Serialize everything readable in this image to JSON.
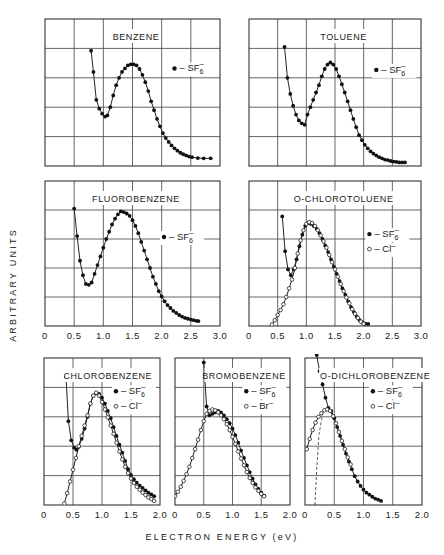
{
  "figure": {
    "ylabel": "ARBITRARY   UNITS",
    "xlabel": "ELECTRON   ENERGY   (eV)"
  },
  "chart_data": [
    {
      "type": "scatter",
      "title": "BENZENE",
      "xlabel": "Electron Energy (eV)",
      "ylabel": "Arbitrary Units",
      "xlim": [
        0,
        3.0
      ],
      "ylim": [
        0,
        5
      ],
      "xticks": [
        "0",
        "0.5",
        "1.0",
        "1.5",
        "2.0",
        "2.5",
        "3.0"
      ],
      "grid": true,
      "legend": [
        "• – SF6⁻"
      ],
      "series": [
        {
          "name": "SF6-",
          "marker": "filled",
          "x": [
            0.79,
            0.83,
            0.88,
            0.93,
            0.98,
            1.03,
            1.07,
            1.12,
            1.17,
            1.22,
            1.27,
            1.32,
            1.37,
            1.42,
            1.47,
            1.52,
            1.57,
            1.62,
            1.67,
            1.72,
            1.77,
            1.82,
            1.87,
            1.92,
            1.97,
            2.02,
            2.07,
            2.12,
            2.17,
            2.22,
            2.27,
            2.32,
            2.37,
            2.42,
            2.47,
            2.52,
            2.62,
            2.72,
            2.84
          ],
          "y": [
            3.92,
            3.2,
            2.25,
            1.95,
            1.78,
            1.68,
            1.72,
            2.0,
            2.4,
            2.75,
            3.0,
            3.2,
            3.32,
            3.42,
            3.46,
            3.46,
            3.42,
            3.3,
            3.1,
            2.85,
            2.55,
            2.2,
            1.9,
            1.6,
            1.35,
            1.12,
            0.95,
            0.82,
            0.7,
            0.6,
            0.52,
            0.45,
            0.4,
            0.36,
            0.32,
            0.3,
            0.27,
            0.26,
            0.26
          ]
        }
      ]
    },
    {
      "type": "scatter",
      "title": "TOLUENE",
      "xlim": [
        0,
        3.0
      ],
      "ylim": [
        0,
        5
      ],
      "xticks": [
        "0",
        "0.5",
        "1.0",
        "1.5",
        "2.0",
        "2.5",
        "3.0"
      ],
      "grid": true,
      "legend": [
        "• – SF6⁻"
      ],
      "series": [
        {
          "name": "SF6-",
          "marker": "filled",
          "x": [
            0.62,
            0.67,
            0.72,
            0.77,
            0.82,
            0.87,
            0.92,
            0.97,
            1.02,
            1.07,
            1.12,
            1.17,
            1.22,
            1.27,
            1.32,
            1.37,
            1.42,
            1.47,
            1.52,
            1.57,
            1.62,
            1.67,
            1.72,
            1.77,
            1.82,
            1.87,
            1.92,
            1.97,
            2.02,
            2.07,
            2.12,
            2.17,
            2.22,
            2.27,
            2.32,
            2.37,
            2.42,
            2.47,
            2.52,
            2.57,
            2.62,
            2.67,
            2.72
          ],
          "y": [
            4.05,
            3.0,
            2.45,
            2.05,
            1.75,
            1.55,
            1.45,
            1.4,
            1.75,
            2.0,
            2.25,
            2.5,
            2.75,
            3.05,
            3.3,
            3.45,
            3.52,
            3.45,
            3.3,
            3.05,
            2.78,
            2.5,
            2.2,
            1.9,
            1.6,
            1.32,
            1.05,
            0.88,
            0.72,
            0.6,
            0.5,
            0.42,
            0.36,
            0.3,
            0.26,
            0.22,
            0.2,
            0.17,
            0.15,
            0.14,
            0.12,
            0.12,
            0.12
          ]
        }
      ]
    },
    {
      "type": "scatter",
      "title": "FLUOROBENZENE",
      "xlim": [
        0,
        3.0
      ],
      "ylim": [
        0,
        5
      ],
      "xticks": [
        "0",
        "0.5",
        "1.0",
        "1.5",
        "2.0",
        "2.5",
        "3.0"
      ],
      "grid": true,
      "legend": [
        "• – SF6⁻"
      ],
      "series": [
        {
          "name": "SF6-",
          "marker": "filled",
          "x": [
            0.5,
            0.55,
            0.6,
            0.65,
            0.7,
            0.75,
            0.8,
            0.85,
            0.9,
            0.95,
            1.0,
            1.05,
            1.1,
            1.15,
            1.2,
            1.25,
            1.3,
            1.35,
            1.4,
            1.45,
            1.5,
            1.55,
            1.6,
            1.65,
            1.7,
            1.75,
            1.8,
            1.85,
            1.9,
            1.95,
            2.0,
            2.05,
            2.1,
            2.15,
            2.2,
            2.25,
            2.3,
            2.35,
            2.4,
            2.45,
            2.5,
            2.55,
            2.6,
            2.63
          ],
          "y": [
            4.05,
            3.1,
            2.25,
            1.75,
            1.45,
            1.42,
            1.5,
            1.8,
            2.1,
            2.4,
            2.7,
            3.0,
            3.25,
            3.5,
            3.7,
            3.85,
            3.95,
            3.93,
            3.88,
            3.8,
            3.65,
            3.45,
            3.2,
            2.9,
            2.6,
            2.3,
            2.0,
            1.7,
            1.45,
            1.2,
            1.02,
            0.85,
            0.72,
            0.62,
            0.52,
            0.45,
            0.38,
            0.32,
            0.28,
            0.25,
            0.22,
            0.2,
            0.18,
            0.17
          ]
        }
      ]
    },
    {
      "type": "scatter",
      "title": "O-CHLOROTOLUENE",
      "xlim": [
        0,
        3.0
      ],
      "ylim": [
        0,
        5
      ],
      "xticks": [
        "0",
        "0.5",
        "1.0",
        "1.5",
        "2.0",
        "2.5",
        "3.0"
      ],
      "grid": true,
      "legend": [
        "• – SF6⁻",
        "◦ – Cl⁻"
      ],
      "series": [
        {
          "name": "SF6-",
          "marker": "filled",
          "x": [
            0.58,
            0.63,
            0.68,
            0.73,
            0.78,
            0.83,
            0.88,
            0.93,
            0.98,
            1.03,
            1.08,
            1.13,
            1.18,
            1.23,
            1.28,
            1.33,
            1.38,
            1.43,
            1.48,
            1.53,
            1.58,
            1.63,
            1.68,
            1.73,
            1.78,
            1.83,
            1.88,
            1.93,
            1.98,
            2.03,
            2.08
          ],
          "y": [
            3.78,
            2.58,
            1.95,
            1.75,
            1.95,
            2.3,
            2.75,
            3.15,
            3.45,
            3.55,
            3.52,
            3.45,
            3.35,
            3.2,
            3.0,
            2.78,
            2.55,
            2.3,
            2.05,
            1.8,
            1.55,
            1.3,
            1.08,
            0.85,
            0.65,
            0.48,
            0.32,
            0.2,
            0.12,
            0.08,
            0.07
          ]
        },
        {
          "name": "Cl-",
          "marker": "open",
          "x": [
            0.4,
            0.45,
            0.5,
            0.55,
            0.6,
            0.65,
            0.7,
            0.75,
            0.8,
            0.85,
            0.9,
            0.95,
            1.0,
            1.05,
            1.1,
            1.15,
            1.2,
            1.25,
            1.3,
            1.35,
            1.4,
            1.45,
            1.5,
            1.55,
            1.6,
            1.65,
            1.7,
            1.75,
            1.8,
            1.85,
            1.9,
            1.95,
            2.0
          ],
          "y": [
            0.05,
            0.2,
            0.38,
            0.55,
            0.75,
            1.0,
            1.3,
            1.6,
            2.0,
            2.5,
            2.95,
            3.3,
            3.52,
            3.58,
            3.55,
            3.45,
            3.3,
            3.12,
            2.92,
            2.7,
            2.45,
            2.2,
            1.95,
            1.7,
            1.45,
            1.2,
            0.98,
            0.78,
            0.58,
            0.42,
            0.28,
            0.15,
            0.08
          ]
        }
      ]
    },
    {
      "type": "scatter",
      "title": "CHLOROBENZENE",
      "xlim": [
        0,
        2.0
      ],
      "ylim": [
        0,
        5
      ],
      "xticks": [
        "0",
        "0.5",
        "1.0",
        "1.5",
        "2.0"
      ],
      "grid": true,
      "legend": [
        "• – SF6⁻",
        "◦ – Cl⁻"
      ],
      "series": [
        {
          "name": "SF6-",
          "marker": "filled",
          "x": [
            0.38,
            0.42,
            0.47,
            0.52,
            0.56,
            0.6,
            0.65,
            0.7,
            0.75,
            0.8,
            0.85,
            0.9,
            0.95,
            1.0,
            1.05,
            1.1,
            1.15,
            1.2,
            1.25,
            1.3,
            1.35,
            1.4,
            1.45,
            1.5,
            1.55,
            1.6,
            1.65,
            1.7,
            1.75,
            1.8,
            1.85,
            1.9
          ],
          "y": [
            4.35,
            2.85,
            2.2,
            1.95,
            1.88,
            1.98,
            2.25,
            2.6,
            3.0,
            3.45,
            3.72,
            3.8,
            3.78,
            3.65,
            3.45,
            3.2,
            2.95,
            2.65,
            2.35,
            2.05,
            1.78,
            1.5,
            1.22,
            1.02,
            0.88,
            0.76,
            0.66,
            0.58,
            0.5,
            0.42,
            0.36,
            0.3
          ]
        },
        {
          "name": "Cl-",
          "marker": "open",
          "x": [
            0.35,
            0.4,
            0.45,
            0.5,
            0.55,
            0.6,
            0.65,
            0.7,
            0.75,
            0.8,
            0.85,
            0.9,
            0.95,
            1.0,
            1.05,
            1.1,
            1.15,
            1.2,
            1.25,
            1.3,
            1.35,
            1.4,
            1.45,
            1.5,
            1.55,
            1.6,
            1.65,
            1.7,
            1.75,
            1.8,
            1.85,
            1.9
          ],
          "y": [
            0.05,
            0.4,
            0.8,
            1.2,
            1.6,
            2.0,
            2.35,
            2.7,
            3.05,
            3.45,
            3.72,
            3.82,
            3.72,
            3.5,
            3.25,
            2.98,
            2.7,
            2.42,
            2.12,
            1.82,
            1.55,
            1.3,
            1.08,
            0.9,
            0.75,
            0.62,
            0.52,
            0.42,
            0.34,
            0.26,
            0.2,
            0.14
          ]
        }
      ]
    },
    {
      "type": "scatter",
      "title": "BROMOBENZENE",
      "xlim": [
        0,
        2.0
      ],
      "ylim": [
        0,
        5
      ],
      "xticks": [
        "0",
        "0.5",
        "1.0",
        "1.5",
        "2.0"
      ],
      "grid": true,
      "legend": [
        "• – SF6⁻",
        "◦ – Br⁻"
      ],
      "series": [
        {
          "name": "SF6-",
          "marker": "filled",
          "x": [
            0.5,
            0.55,
            0.6,
            0.65,
            0.7,
            0.75,
            0.8,
            0.85,
            0.9,
            0.95,
            1.0,
            1.05,
            1.1,
            1.15,
            1.2,
            1.25,
            1.3,
            1.35,
            1.4,
            1.45,
            1.5,
            1.55
          ],
          "y": [
            4.85,
            3.35,
            3.05,
            3.1,
            3.15,
            3.2,
            3.15,
            3.05,
            2.92,
            2.78,
            2.6,
            2.38,
            2.12,
            1.85,
            1.6,
            1.35,
            1.12,
            0.9,
            0.7,
            0.55,
            0.42,
            0.32
          ]
        },
        {
          "name": "Br-",
          "marker": "open",
          "x": [
            0.0,
            0.05,
            0.1,
            0.15,
            0.2,
            0.25,
            0.3,
            0.35,
            0.4,
            0.45,
            0.5,
            0.55,
            0.6,
            0.65,
            0.7,
            0.75,
            0.8,
            0.85,
            0.9,
            0.95,
            1.0,
            1.05,
            1.1,
            1.15,
            1.2,
            1.25,
            1.3,
            1.35,
            1.4,
            1.45,
            1.5,
            1.55
          ],
          "y": [
            0.3,
            0.45,
            0.62,
            0.82,
            1.05,
            1.3,
            1.6,
            1.9,
            2.22,
            2.55,
            2.85,
            3.1,
            3.2,
            3.25,
            3.22,
            3.15,
            3.05,
            2.92,
            2.75,
            2.55,
            2.32,
            2.08,
            1.82,
            1.58,
            1.35,
            1.12,
            0.92,
            0.75,
            0.6,
            0.48,
            0.38,
            0.3
          ]
        }
      ]
    },
    {
      "type": "scatter",
      "title": "O-DICHLOROBENZENE",
      "xlim": [
        0,
        2.0
      ],
      "ylim": [
        0,
        5
      ],
      "xticks": [
        "0",
        "0.5",
        "1.0",
        "1.5",
        "2.0"
      ],
      "grid": true,
      "legend": [
        "• – SF6⁻",
        "◦ – Cl⁻"
      ],
      "series": [
        {
          "name": "SF6-",
          "marker": "filled",
          "x": [
            0.2,
            0.25,
            0.3,
            0.35,
            0.4,
            0.45,
            0.5,
            0.55,
            0.6,
            0.65,
            0.7,
            0.75,
            0.8,
            0.85,
            0.9,
            0.95,
            1.0,
            1.05,
            1.1,
            1.15,
            1.2,
            1.25,
            1.3
          ],
          "y": [
            5.1,
            4.55,
            4.1,
            3.65,
            3.3,
            3.2,
            2.95,
            2.65,
            2.35,
            2.05,
            1.75,
            1.48,
            1.22,
            0.98,
            0.8,
            0.65,
            0.52,
            0.42,
            0.35,
            0.28,
            0.22,
            0.18,
            0.14
          ]
        },
        {
          "name": "Cl-",
          "marker": "open",
          "x": [
            0.03,
            0.08,
            0.13,
            0.18,
            0.23,
            0.28,
            0.33,
            0.38,
            0.43,
            0.48,
            0.53,
            0.58,
            0.63,
            0.68,
            0.73,
            0.78
          ],
          "y": [
            1.9,
            2.25,
            2.55,
            2.8,
            3.0,
            3.12,
            3.22,
            3.25,
            3.2,
            3.02,
            2.78,
            2.48,
            2.18,
            1.9,
            1.62,
            1.38
          ]
        },
        {
          "name": "dashed-extrapolation",
          "marker": "none",
          "style": "dashed",
          "x": [
            0.17,
            0.2,
            0.24,
            0.3
          ],
          "y": [
            0.0,
            1.2,
            2.4,
            3.1
          ]
        }
      ]
    }
  ]
}
